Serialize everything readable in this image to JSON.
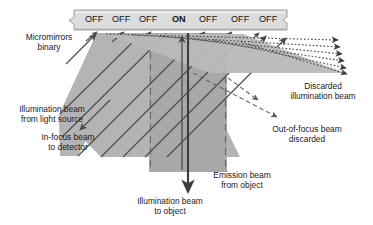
{
  "diagram": {
    "colors": {
      "beam_fill": "#b4b4b4",
      "beam_fill_dark": "#a0a0a0",
      "band_fill": "#ababab",
      "bar_fill": "#dcdcdc",
      "bar_stroke": "#9a9a9a",
      "line": "#555555",
      "line_dark": "#3d3d3d",
      "dashed": "#6e6e6e",
      "text": "#1a1a1a",
      "background": "#ffffff"
    },
    "mirror_bar": {
      "name": "micromirror-array-bar",
      "cells": [
        {
          "label": "OFF",
          "state": "off"
        },
        {
          "label": "OFF",
          "state": "off"
        },
        {
          "label": "OFF",
          "state": "off"
        },
        {
          "label": "ON",
          "state": "on"
        },
        {
          "label": "OFF",
          "state": "off"
        },
        {
          "label": "OFF",
          "state": "off"
        },
        {
          "label": "OFF",
          "state": "off"
        }
      ]
    },
    "annotations": [
      {
        "key": "micromirrors",
        "line1": "Micromirrors",
        "line2": "binary",
        "align": "center"
      },
      {
        "key": "illumination_source",
        "line1": "Illumination beam",
        "line2": "from light source",
        "align": "center"
      },
      {
        "key": "in_focus",
        "line1": "In-focus beam",
        "line2": "to detector",
        "align": "center"
      },
      {
        "key": "discarded_illumination",
        "line1": "Discarded",
        "line2": "illumination beam",
        "align": "center"
      },
      {
        "key": "out_of_focus",
        "line1": "Out-of-focus beam",
        "line2": "discarded",
        "align": "center"
      },
      {
        "key": "emission",
        "line1": "Emission beam",
        "line2": "from object",
        "align": "center"
      },
      {
        "key": "illumination_object",
        "line1": "Illumination beam",
        "line2": "to object",
        "align": "center"
      }
    ]
  }
}
